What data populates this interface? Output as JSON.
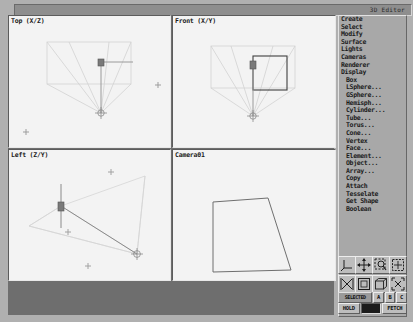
{
  "app": {
    "title": "3D Editor"
  },
  "viewports": [
    {
      "name": "top",
      "label": "Top (X/Z)"
    },
    {
      "name": "front",
      "label": "Front (X/Y)"
    },
    {
      "name": "left",
      "label": "Left (Z/Y)"
    },
    {
      "name": "camera",
      "label": "Camera01"
    }
  ],
  "menu": {
    "header": "3D Editor",
    "groups": [
      {
        "items": [
          {
            "label": "Create",
            "indent": false
          },
          {
            "label": "Select",
            "indent": false
          },
          {
            "label": "Modify",
            "indent": false
          },
          {
            "label": "Surface",
            "indent": false
          },
          {
            "label": "Lights",
            "indent": false
          },
          {
            "label": "Cameras",
            "indent": false
          },
          {
            "label": "Renderer",
            "indent": false
          },
          {
            "label": "Display",
            "indent": false
          }
        ]
      },
      {
        "items": [
          {
            "label": "Box",
            "indent": true
          },
          {
            "label": "LSphere...",
            "indent": true
          },
          {
            "label": "GSphere...",
            "indent": true
          },
          {
            "label": "Hemisph...",
            "indent": true
          },
          {
            "label": "Cylinder...",
            "indent": true
          },
          {
            "label": "Tube...",
            "indent": true
          },
          {
            "label": "Torus...",
            "indent": true
          },
          {
            "label": "Cone...",
            "indent": true
          },
          {
            "label": "Vertex",
            "indent": true
          },
          {
            "label": "Face...",
            "indent": true
          },
          {
            "label": "Element...",
            "indent": true
          },
          {
            "label": "Object...",
            "indent": true
          }
        ]
      },
      {
        "items": [
          {
            "label": "Array...",
            "indent": true
          },
          {
            "label": "Copy",
            "indent": true
          },
          {
            "label": "Attach",
            "indent": true
          },
          {
            "label": "Tesselate",
            "indent": true
          },
          {
            "label": "Get Shape",
            "indent": true
          },
          {
            "label": "Boolean",
            "indent": true
          }
        ]
      }
    ]
  },
  "toolbar": {
    "icons": [
      {
        "name": "axis-tripod-icon",
        "title": "Axis"
      },
      {
        "name": "move-arrows-icon",
        "title": "Move"
      },
      {
        "name": "zoom-region-icon",
        "title": "Zoom Region"
      },
      {
        "name": "grid-icon",
        "title": "Grid"
      },
      {
        "name": "scale-icon",
        "title": "Scale"
      },
      {
        "name": "view-square-icon",
        "title": "View"
      },
      {
        "name": "cube-icon",
        "title": "Cube"
      },
      {
        "name": "zoom-extents-icon",
        "title": "Zoom Extents"
      }
    ],
    "selected_label": "SELECTED",
    "abc_buttons": [
      "A",
      "B",
      "C"
    ],
    "hold_label": "HOLD",
    "fetch_label": "FETCH",
    "hold_field_value": ""
  },
  "colors": {
    "background": "#b0b0b0",
    "panel": "#a8a8a8",
    "viewport_bg": "#f3f3f3",
    "wireframe": "#cfcfcf",
    "selected": "#4a4a4a",
    "marker": "#8f8f8f"
  }
}
